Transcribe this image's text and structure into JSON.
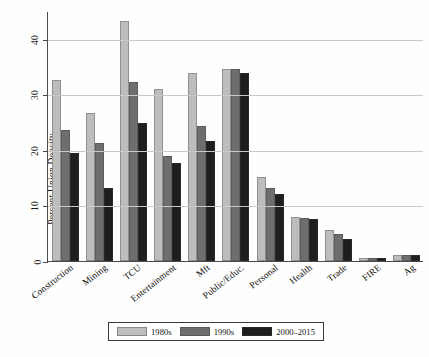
{
  "chart_data": {
    "type": "bar",
    "title": "",
    "xlabel": "",
    "ylabel": "Percent Union Density",
    "ylim": [
      0,
      45
    ],
    "yticks": [
      0,
      10,
      20,
      30,
      40
    ],
    "grid": true,
    "legend_position": "bottom",
    "categories": [
      "Construction",
      "Mining",
      "TCU",
      "Entertainment",
      "Mft",
      "Public/Educ.",
      "Personal",
      "Health",
      "Trade",
      "FIRE",
      "Ag"
    ],
    "series": [
      {
        "name": "1980s",
        "color": "#bdbdbd",
        "values": [
          32.6,
          26.6,
          43.2,
          30.9,
          33.9,
          34.5,
          15.2,
          8.0,
          5.5,
          0.6,
          1.1
        ]
      },
      {
        "name": "1990s",
        "color": "#6e6e6e",
        "values": [
          23.5,
          21.2,
          32.2,
          18.9,
          24.3,
          34.6,
          13.2,
          7.7,
          4.9,
          0.5,
          1.0
        ]
      },
      {
        "name": "2000-2015",
        "color": "#1e1e1e",
        "values": [
          19.4,
          13.2,
          24.9,
          17.6,
          21.6,
          33.8,
          12.0,
          7.6,
          3.9,
          0.5,
          1.0
        ]
      }
    ]
  },
  "axis": {
    "y_title": "Percent Union Density",
    "y_tick_labels": [
      "0",
      "10",
      "20",
      "30",
      "40"
    ]
  },
  "legend": {
    "items": [
      {
        "label": "1980s",
        "color": "#bdbdbd"
      },
      {
        "label": "1990s",
        "color": "#6e6e6e"
      },
      {
        "label": "2000–2015",
        "color": "#1e1e1e"
      }
    ]
  }
}
